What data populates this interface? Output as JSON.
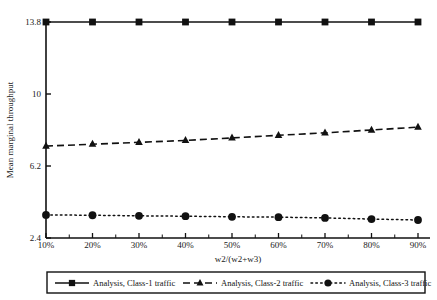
{
  "chart_data": {
    "type": "line",
    "title": "",
    "xlabel": "w2/(w2+w3)",
    "ylabel": "Mean marginal throughput",
    "categories": [
      "10%",
      "20%",
      "30%",
      "40%",
      "50%",
      "60%",
      "70%",
      "80%",
      "90%"
    ],
    "x_tick_labels": [
      "10%",
      "20%",
      "30%",
      "40%",
      "50%",
      "60%",
      "70%",
      "80%",
      "90%"
    ],
    "y_tick_labels": [
      "2.4",
      "6.2",
      "10",
      "13.8"
    ],
    "y_tick_values": [
      2.4,
      6.2,
      10,
      13.8
    ],
    "ylim": [
      2.4,
      13.8
    ],
    "grid": false,
    "legend_position": "bottom",
    "series": [
      {
        "name": "Analysis, Class-1 traffic",
        "marker": "square",
        "line_style": "solid",
        "color": "#111111",
        "values": [
          13.8,
          13.8,
          13.8,
          13.8,
          13.8,
          13.8,
          13.8,
          13.8,
          13.8
        ]
      },
      {
        "name": "Analysis, Class-2 traffic",
        "marker": "triangle",
        "line_style": "dashed",
        "color": "#111111",
        "values": [
          7.25,
          7.35,
          7.45,
          7.55,
          7.68,
          7.82,
          7.95,
          8.1,
          8.25
        ]
      },
      {
        "name": "Analysis, Class-3 traffic",
        "marker": "circle",
        "line_style": "dotted",
        "color": "#111111",
        "values": [
          3.62,
          3.6,
          3.57,
          3.55,
          3.52,
          3.5,
          3.46,
          3.4,
          3.35
        ]
      }
    ]
  },
  "legend": {
    "items": [
      {
        "label": "Analysis, Class-1 traffic",
        "marker": "square",
        "line_style": "solid"
      },
      {
        "label": "Analysis, Class-2 traffic",
        "marker": "triangle",
        "line_style": "dashed"
      },
      {
        "label": "Analysis, Class-3 traffic",
        "marker": "circle",
        "line_style": "dotted"
      }
    ]
  }
}
